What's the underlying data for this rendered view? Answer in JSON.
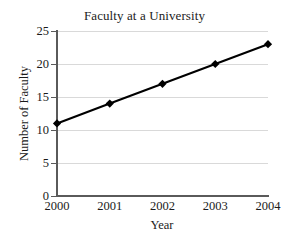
{
  "chart_data": {
    "type": "line",
    "title": "Faculty at a University",
    "xlabel": "Year",
    "ylabel": "Number of Faculty",
    "categories": [
      "2000",
      "2001",
      "2002",
      "2003",
      "2004"
    ],
    "x": [
      2000,
      2001,
      2002,
      2003,
      2004
    ],
    "values": [
      11,
      14,
      17,
      20,
      23
    ],
    "series": [
      {
        "name": "Number of Faculty",
        "values": [
          11,
          14,
          17,
          20,
          23
        ]
      }
    ],
    "ylim": [
      0,
      25
    ],
    "yticks": [
      0,
      5,
      10,
      15,
      20,
      25
    ],
    "ytick_labels": [
      "0",
      "5",
      "10",
      "15",
      "20",
      "25"
    ],
    "xlim": [
      2000,
      2004
    ],
    "grid": "horizontal",
    "legend": "none",
    "marker": "diamond",
    "colors": {
      "line": "#000000",
      "marker": "#000000",
      "gridline": "#d9d9d9",
      "axis": "#5a5a5a",
      "background": "#ffffff",
      "text": "#1a1a1a"
    }
  }
}
